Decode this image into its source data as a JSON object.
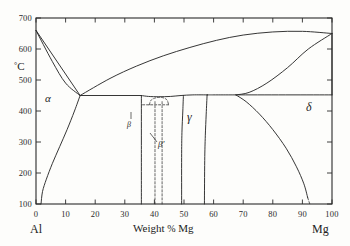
{
  "chart_data": {
    "type": "line",
    "title": "",
    "xlabel": "Weight % Mg",
    "ylabel": "°C",
    "xlim": [
      0,
      100
    ],
    "ylim": [
      100,
      700
    ],
    "grid": false,
    "legend_position": "none",
    "x_ticks": [
      0,
      10,
      20,
      30,
      40,
      50,
      60,
      70,
      80,
      90,
      100
    ],
    "x_tick_labels": [
      "0",
      "10",
      "20",
      "30",
      "40",
      "50",
      "60",
      "70",
      "80",
      "90",
      "100"
    ],
    "y_ticks": [
      100,
      200,
      300,
      400,
      500,
      600,
      700
    ],
    "y_tick_labels": [
      "100",
      "200",
      "300",
      "400",
      "500",
      "600",
      "700"
    ],
    "corner_left_label": "Al",
    "corner_right_label": "Mg",
    "phase_labels": [
      {
        "name": "alpha",
        "text": "α",
        "x": 8,
        "y": 430
      },
      {
        "name": "beta",
        "text": "β",
        "x": 36,
        "y": 330
      },
      {
        "name": "beta-prime",
        "text": "β'",
        "x": 46,
        "y": 283
      },
      {
        "name": "gamma",
        "text": "γ",
        "x": 54,
        "y": 368
      },
      {
        "name": "delta",
        "text": "δ",
        "x": 94,
        "y": 400
      }
    ],
    "series": [
      {
        "name": "al-liquidus",
        "style": "solid",
        "points": [
          [
            0,
            660
          ],
          [
            14.9,
            450
          ]
        ]
      },
      {
        "name": "al-solidus-solvus",
        "style": "solid",
        "points": [
          [
            0,
            660
          ],
          [
            5.5,
            560
          ],
          [
            10.0,
            490
          ],
          [
            14.9,
            450
          ]
        ]
      },
      {
        "name": "alpha-solvus",
        "style": "solid",
        "points": [
          [
            14.9,
            450
          ],
          [
            13.0,
            400
          ],
          [
            10.5,
            340
          ],
          [
            8.0,
            285
          ],
          [
            5.5,
            230
          ],
          [
            3.5,
            180
          ],
          [
            2.2,
            140
          ],
          [
            1.7,
            100
          ]
        ]
      },
      {
        "name": "left-eutectic-horizontal",
        "style": "solid",
        "points": [
          [
            14.9,
            450
          ],
          [
            35.6,
            450
          ]
        ]
      },
      {
        "name": "beta-liquidus-left",
        "style": "solid",
        "points": [
          [
            14.9,
            450
          ],
          [
            25.0,
            505
          ],
          [
            34.0,
            545
          ],
          [
            43.0,
            578
          ],
          [
            52.0,
            605
          ],
          [
            61.0,
            628
          ],
          [
            70.0,
            645
          ],
          [
            80.0,
            655
          ],
          [
            90.0,
            657
          ],
          [
            100,
            650
          ]
        ]
      },
      {
        "name": "beta-dome-top",
        "style": "solid",
        "points": [
          [
            35.6,
            450
          ],
          [
            38.0,
            447
          ],
          [
            41.5,
            446
          ],
          [
            45.5,
            447
          ],
          [
            49.0,
            450
          ],
          [
            53.0,
            452
          ],
          [
            58.0,
            452
          ]
        ]
      },
      {
        "name": "beta-left-boundary",
        "style": "solid",
        "points": [
          [
            35.6,
            450
          ],
          [
            35.6,
            300
          ],
          [
            35.6,
            100
          ]
        ]
      },
      {
        "name": "beta-right-boundary",
        "style": "solid",
        "points": [
          [
            49.8,
            450
          ],
          [
            49.6,
            400
          ],
          [
            49.3,
            330
          ],
          [
            49.2,
            250
          ],
          [
            49.2,
            100
          ]
        ]
      },
      {
        "name": "beta-prime-left-dashed",
        "style": "dashed",
        "points": [
          [
            40.2,
            430
          ],
          [
            40.2,
            360
          ],
          [
            40.2,
            260
          ],
          [
            40.2,
            100
          ]
        ]
      },
      {
        "name": "beta-prime-right-dashed",
        "style": "dashed",
        "points": [
          [
            42.6,
            430
          ],
          [
            42.6,
            360
          ],
          [
            42.6,
            260
          ],
          [
            42.6,
            100
          ]
        ]
      },
      {
        "name": "beta-prime-dome-dashed",
        "style": "dashed",
        "points": [
          [
            38.3,
            420
          ],
          [
            38.8,
            434
          ],
          [
            40.0,
            441
          ],
          [
            41.6,
            444
          ],
          [
            43.2,
            442
          ],
          [
            44.3,
            435
          ],
          [
            44.8,
            420
          ]
        ]
      },
      {
        "name": "beta-inner-dashed-horizontal",
        "style": "dashed",
        "points": [
          [
            36.0,
            420
          ],
          [
            44.8,
            420
          ]
        ]
      },
      {
        "name": "gamma-right-boundary",
        "style": "solid",
        "points": [
          [
            57.8,
            452
          ],
          [
            57.5,
            390
          ],
          [
            57.2,
            320
          ],
          [
            57.0,
            240
          ],
          [
            56.9,
            100
          ]
        ]
      },
      {
        "name": "gamma-peritectic-horizontal",
        "style": "solid",
        "points": [
          [
            57.8,
            452
          ],
          [
            67.5,
            452
          ],
          [
            100,
            452
          ]
        ]
      },
      {
        "name": "delta-liquidus",
        "style": "solid",
        "points": [
          [
            100,
            650
          ],
          [
            92.0,
            600
          ],
          [
            85.0,
            540
          ],
          [
            78.0,
            490
          ],
          [
            72.0,
            460
          ],
          [
            67.5,
            452
          ]
        ]
      },
      {
        "name": "delta-solvus",
        "style": "solid",
        "points": [
          [
            67.5,
            452
          ],
          [
            71.0,
            430
          ],
          [
            75.5,
            390
          ],
          [
            80.0,
            340
          ],
          [
            84.5,
            280
          ],
          [
            88.0,
            220
          ],
          [
            90.5,
            165
          ],
          [
            91.8,
            120
          ]
        ]
      },
      {
        "name": "delta-solvus-extension-dashed",
        "style": "dashed",
        "points": [
          [
            91.8,
            120
          ],
          [
            92.5,
            100
          ]
        ]
      },
      {
        "name": "mg-right-edge-upper",
        "style": "solid",
        "points": [
          [
            100,
            650
          ],
          [
            100,
            452
          ]
        ]
      }
    ]
  }
}
